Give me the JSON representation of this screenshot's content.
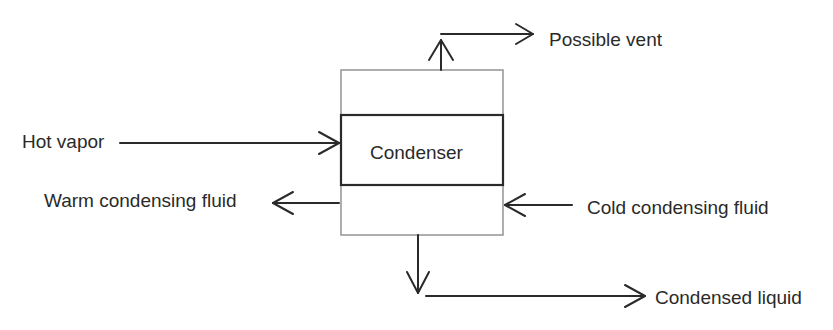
{
  "diagram": {
    "center_label": "Condenser",
    "streams": {
      "vent": "Possible vent",
      "hot_vapor": "Hot vapor",
      "warm_fluid": "Warm condensing fluid",
      "cold_fluid": "Cold condensing fluid",
      "condensed_liquid": "Condensed liquid"
    }
  }
}
